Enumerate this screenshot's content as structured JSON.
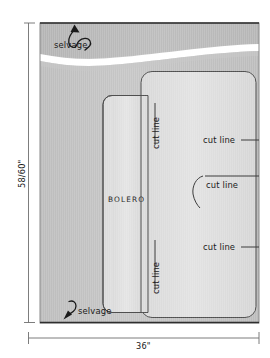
{
  "diagram": {
    "garment_label": "BOLERO",
    "dimensions": {
      "height_label": "58/60\"",
      "width_label": "36\""
    },
    "selvage_labels": [
      {
        "text": "selvage",
        "position": "top"
      },
      {
        "text": "selvage",
        "position": "bottom"
      }
    ],
    "cut_lines": [
      {
        "text": "cut line",
        "orientation": "vertical",
        "position": "upper-center"
      },
      {
        "text": "cut line",
        "orientation": "horizontal",
        "position": "upper-right"
      },
      {
        "text": "cut line",
        "orientation": "horizontal",
        "position": "middle-right"
      },
      {
        "text": "cut line",
        "orientation": "horizontal",
        "position": "lower-right"
      },
      {
        "text": "cut line",
        "orientation": "vertical",
        "position": "lower-center"
      }
    ],
    "colors": {
      "fabric_dark": "#b9b9b9",
      "fabric_mid": "#c4c4c4",
      "panel_light": "#dcdcdc",
      "panel_light_2": "#e0e0e0",
      "outline": "#4a4a4a",
      "dimension_line": "#6e6e6e",
      "white_fold": "#ffffff",
      "text": "#1a1a1a"
    }
  }
}
